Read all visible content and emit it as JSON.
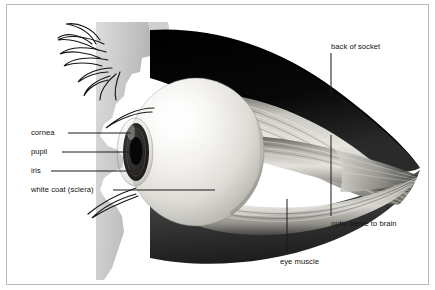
{
  "figure": {
    "type": "anatomical-illustration",
    "border_color": "#b9b9b9",
    "background_color": "#ffffff"
  },
  "labels": {
    "cornea": "cornea",
    "pupil": "pupil",
    "iris": "iris",
    "sclera": "white coat (sclera)",
    "back_of_socket": "back of socket",
    "optic_nerve": "optic nerve to brain",
    "eye_muscle": "eye muscle"
  },
  "palette": {
    "socket_dark": "#0a0a0a",
    "socket_mid": "#3a3a3a",
    "muscle_light": "#d8d6d2",
    "muscle_mid": "#9a9892",
    "sclera_white": "#f2f0ec",
    "sclera_shadow": "#b4b2ac",
    "face_grey": "#c9c9c9",
    "iris_dark": "#2a2a26",
    "pupil_black": "#080808",
    "lash_black": "#151515",
    "leader_line": "#1a1a1a",
    "text": "#111111"
  },
  "structures": [
    {
      "name": "face-profile",
      "description": "light grey lateral head profile with eyelid at upper left"
    },
    {
      "name": "eyelashes-upper",
      "description": "curling dark lashes at top left"
    },
    {
      "name": "eyelashes-lower",
      "description": "curving dark lashes at lower left"
    },
    {
      "name": "eyeball",
      "description": "bright spherical globe with highlight at upper left"
    },
    {
      "name": "iris",
      "description": "dark elliptical iris at front of globe"
    },
    {
      "name": "pupil",
      "description": "black aperture at center of iris"
    },
    {
      "name": "cornea",
      "description": "transparent bulge over iris"
    },
    {
      "name": "eye-muscles",
      "description": "pale banded recti muscles radiating backward from globe"
    },
    {
      "name": "socket-cavity",
      "description": "near-black orbital cavity surrounding globe"
    },
    {
      "name": "optic-nerve",
      "description": "tapering cone at right apex leading to brain"
    }
  ]
}
